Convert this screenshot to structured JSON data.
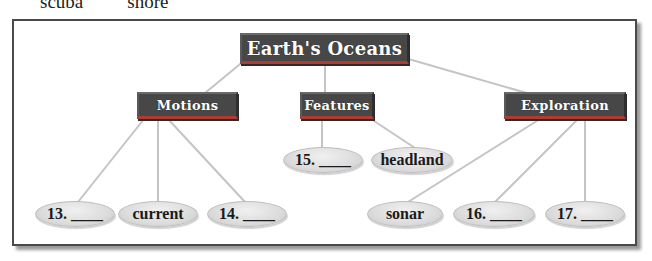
{
  "header_words": [
    "scuba",
    "shore"
  ],
  "diagram": {
    "title": "Earth's Oceans",
    "categories": [
      {
        "label": "Motions",
        "children": [
          "13. ____",
          "current",
          "14. ____"
        ]
      },
      {
        "label": "Features",
        "children": [
          "15. ____",
          "headland"
        ]
      },
      {
        "label": "Exploration",
        "children": [
          "sonar",
          "16. ____",
          "17. ____"
        ]
      }
    ]
  },
  "colors": {
    "box_fill": "#474747",
    "box_text": "#ffffff",
    "box_accent": "#b33a2e",
    "ellipse_fill": "#dcdcdc",
    "connector": "#c4c4c4",
    "frame": "#4a4a4a"
  }
}
